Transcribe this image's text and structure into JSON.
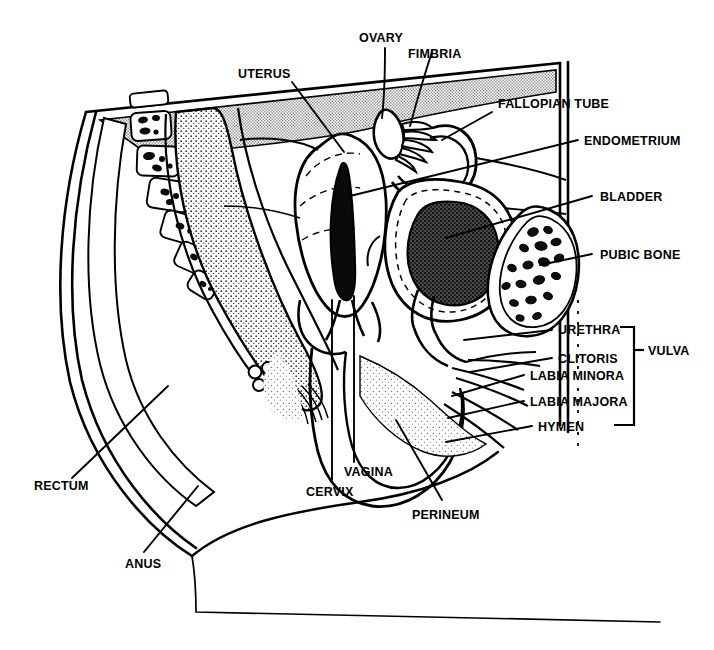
{
  "figure": {
    "type": "anatomical-line-diagram",
    "width": 714,
    "height": 650,
    "background_color": "#ffffff",
    "line_color": "#000000",
    "shade_color": "#b4b4b4",
    "stipple_color": "#6e6e6e"
  },
  "labels": {
    "ovary": "OVARY",
    "fimbria": "FIMBRIA",
    "uterus": "UTERUS",
    "fallopian_tube": "FALLOPIAN TUBE",
    "endometrium": "ENDOMETRIUM",
    "bladder": "BLADDER",
    "pubic_bone": "PUBIC BONE",
    "urethra": "URETHRA",
    "clitoris": "CLITORIS",
    "labia_minora": "LABIA MINORA",
    "labia_majora": "LABIA MAJORA",
    "hymen": "HYMEN",
    "vulva": "VULVA",
    "vagina": "VAGINA",
    "cervix": "CERVIX",
    "perineum": "PERINEUM",
    "rectum": "RECTUM",
    "anus": "ANUS"
  },
  "groups": {
    "vulva_members": [
      "URETHRA",
      "CLITORIS",
      "LABIA MINORA",
      "LABIA MAJORA",
      "HYMEN"
    ]
  },
  "structures": [
    {
      "name": "sacrum-vertebrae",
      "count": 6,
      "fill": "outline-with-dark-trabeculae"
    },
    {
      "name": "rectum",
      "fill": "stipple"
    },
    {
      "name": "uterus",
      "fill": "white-outline"
    },
    {
      "name": "endometrial-cavity",
      "fill": "black"
    },
    {
      "name": "bladder",
      "fill": "white-outline-dashed"
    },
    {
      "name": "bladder-contents",
      "fill": "dark-stipple"
    },
    {
      "name": "pubic-bone",
      "fill": "trabecular"
    },
    {
      "name": "peritoneum-band",
      "fill": "halftone-gray"
    },
    {
      "name": "vaginal-canal",
      "fill": "white"
    },
    {
      "name": "perineum-soft-tissue",
      "fill": "light-stipple"
    }
  ]
}
